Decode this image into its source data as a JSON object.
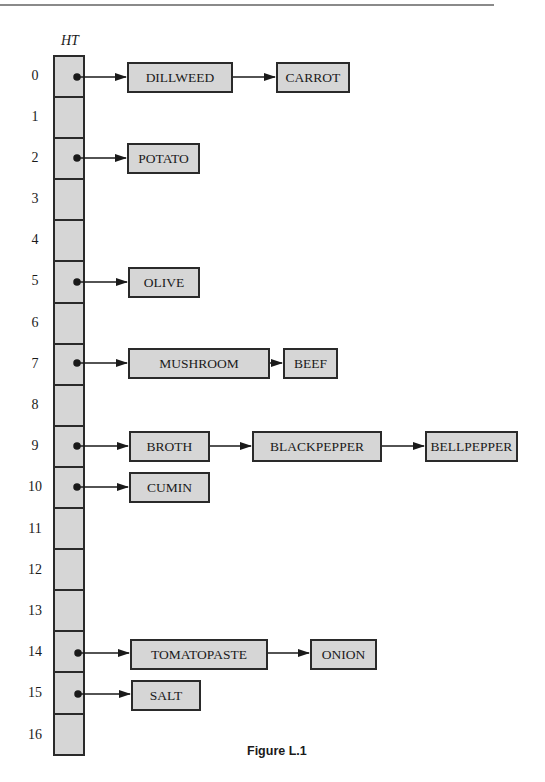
{
  "figure": {
    "table_label": "HT",
    "caption": "Figure L.1",
    "row_count": 17,
    "indices": [
      "0",
      "1",
      "2",
      "3",
      "4",
      "5",
      "6",
      "7",
      "8",
      "9",
      "10",
      "11",
      "12",
      "13",
      "14",
      "15",
      "16"
    ],
    "fill_color": "#d6d6d6",
    "line_color": "#2a2a2a"
  },
  "chains": [
    {
      "index": 0,
      "nodes": [
        "DILLWEED",
        "CARROT"
      ]
    },
    {
      "index": 2,
      "nodes": [
        "POTATO"
      ]
    },
    {
      "index": 5,
      "nodes": [
        "OLIVE"
      ]
    },
    {
      "index": 7,
      "nodes": [
        "MUSHROOM",
        "BEEF"
      ]
    },
    {
      "index": 9,
      "nodes": [
        "BROTH",
        "BLACKPEPPER",
        "BELLPEPPER"
      ]
    },
    {
      "index": 10,
      "nodes": [
        "CUMIN"
      ]
    },
    {
      "index": 14,
      "nodes": [
        "TOMATOPASTE",
        "ONION"
      ]
    },
    {
      "index": 15,
      "nodes": [
        "SALT"
      ]
    }
  ]
}
